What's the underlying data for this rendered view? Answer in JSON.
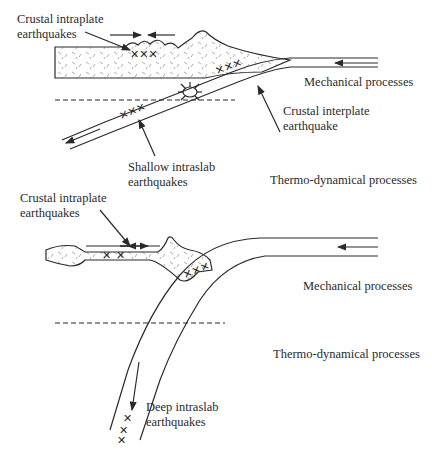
{
  "top_panel": {
    "labels": {
      "crustal_intraplate": [
        "Crustal intraplate",
        "earthquakes"
      ],
      "mechanical": "Mechanical processes",
      "crustal_interplate": [
        "Crustal interplate",
        "earthquake"
      ],
      "shallow_intraslab": [
        "Shallow intraslab",
        "earthquakes"
      ],
      "thermo": "Thermo-dynamical processes"
    }
  },
  "bottom_panel": {
    "labels": {
      "crustal_intraplate": [
        "Crustal intraplate",
        "earthquakes"
      ],
      "mechanical": "Mechanical processes",
      "thermo": "Thermo-dynamical processes",
      "deep_intraslab": [
        "Deep intraslab",
        "earthquakes"
      ]
    }
  },
  "colors": {
    "line": "#2a2a2a",
    "background": "#ffffff",
    "stipple": "#8a8a8a"
  },
  "symbols": {
    "earthquake_marker": "×"
  }
}
